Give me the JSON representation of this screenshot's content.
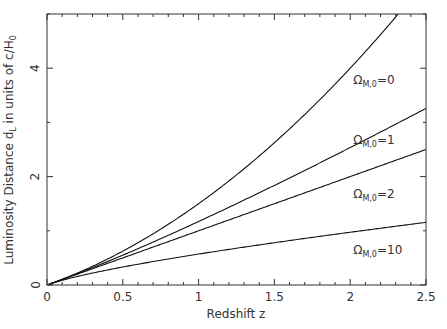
{
  "chart_data": {
    "type": "line",
    "title": "",
    "xlabel": "Redshift z",
    "ylabel": "Luminosity Distance d_L in units of c/H_0",
    "ylabel_parts": {
      "main": "Luminosity Distance d",
      "sub1": "L",
      "mid": " in units of c/H",
      "sub2": "0"
    },
    "xlim": [
      0,
      2.5
    ],
    "ylim": [
      0,
      5
    ],
    "xticks": [
      0,
      0.5,
      1,
      1.5,
      2,
      2.5
    ],
    "xtick_labels": [
      "0",
      "0.5",
      "1",
      "1.5",
      "2",
      "2.5"
    ],
    "xminor_step": 0.1,
    "yticks": [
      0,
      2,
      4
    ],
    "ytick_labels": [
      "0",
      "2",
      "4"
    ],
    "yminor_step": 1,
    "grid": false,
    "legend": "inline annotations",
    "x": [
      0,
      0.25,
      0.5,
      0.75,
      1.0,
      1.25,
      1.5,
      1.75,
      2.0,
      2.25,
      2.5
    ],
    "series": [
      {
        "name": "Ω_M,0=0",
        "omega": 0,
        "values": [
          0,
          0.281,
          0.625,
          1.031,
          1.5,
          2.031,
          2.625,
          3.281,
          4.0,
          4.781,
          5.625
        ]
      },
      {
        "name": "Ω_M,0=1",
        "omega": 1,
        "values": [
          0,
          0.264,
          0.551,
          0.858,
          1.172,
          1.5,
          1.838,
          2.185,
          2.536,
          2.896,
          3.258
        ]
      },
      {
        "name": "Ω_M,0=2",
        "omega": 2,
        "values": [
          0,
          0.25,
          0.5,
          0.75,
          1.0,
          1.25,
          1.5,
          1.75,
          2.0,
          2.25,
          2.5
        ]
      },
      {
        "name": "Ω_M,0=10",
        "omega": 10,
        "values": [
          0,
          0.186,
          0.331,
          0.457,
          0.571,
          0.677,
          0.777,
          0.871,
          0.961,
          1.047,
          1.13
        ]
      }
    ],
    "annotations": [
      {
        "text": "Ω",
        "sub": "M,0",
        "rest": "=0",
        "x": 2.02,
        "y": 3.7
      },
      {
        "text": "Ω",
        "sub": "M,0",
        "rest": "=1",
        "x": 2.02,
        "y": 2.6
      },
      {
        "text": "Ω",
        "sub": "M,0",
        "rest": "=2",
        "x": 2.02,
        "y": 1.6
      },
      {
        "text": "Ω",
        "sub": "M,0",
        "rest": "=10",
        "x": 2.02,
        "y": 0.57
      }
    ]
  },
  "colors": {
    "line": "#111111",
    "frame": "#333333",
    "text": "#333333"
  }
}
